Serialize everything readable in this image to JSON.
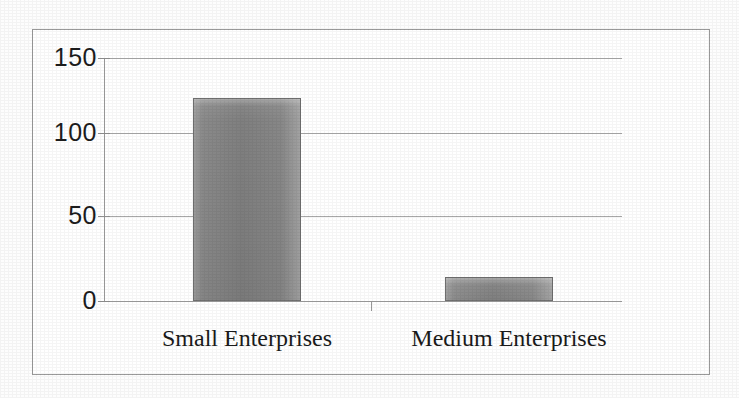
{
  "chart_data": {
    "type": "bar",
    "title": "",
    "subtitle": "",
    "xlabel": "",
    "ylabel": "",
    "categories": [
      "Small Enterprises",
      "Medium Enterprises"
    ],
    "values": [
      125,
      15
    ],
    "series": [
      {
        "name": "",
        "values": [
          125,
          15
        ]
      }
    ],
    "ylim": [
      0,
      150
    ],
    "ytick_labels": [
      "0",
      "50",
      "100",
      "150"
    ],
    "ytick_values": [
      0,
      50,
      100,
      150
    ],
    "grid": true,
    "grid_axis": "y",
    "legend": false,
    "legend_position": "none",
    "annotations": [],
    "bar_color": "#8a8a8a",
    "bar_border_color": "#6f6f6f",
    "gridline_color": "#a8a8a8",
    "axis_color": "#9d9d9d",
    "frame_color": "#9a9a9a",
    "text_color": "#1a1a1a",
    "background_color": "#ffffff"
  },
  "axis": {
    "y": {
      "ticks": [
        {
          "label": "150",
          "value": 150
        },
        {
          "label": "100",
          "value": 100
        },
        {
          "label": "50",
          "value": 50
        },
        {
          "label": "0",
          "value": 0
        }
      ]
    },
    "x": {
      "ticks": [
        {
          "label": "Small Enterprises"
        },
        {
          "label": "Medium Enterprises"
        }
      ]
    }
  }
}
